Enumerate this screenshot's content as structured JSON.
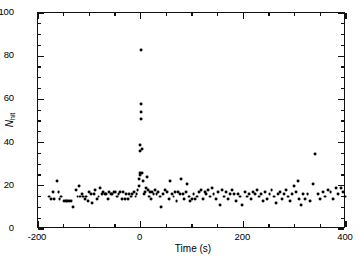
{
  "chart_data": {
    "type": "scatter",
    "title": "",
    "xlabel": "Time (s)",
    "ylabel": "Nhit",
    "ylabel_base": "N",
    "ylabel_sub": "hit",
    "xlim": [
      -200,
      400
    ],
    "ylim": [
      0,
      100
    ],
    "xticks": [
      -200,
      0,
      200,
      400
    ],
    "xticklabels": [
      "-200",
      "0",
      "200",
      "400"
    ],
    "yticks": [
      0,
      20,
      40,
      60,
      80,
      100
    ],
    "yticklabels": [
      "0",
      "20",
      "40",
      "60",
      "80",
      "100"
    ],
    "x_minor_interval": 50,
    "y_minor_interval": 5,
    "grid": false,
    "legend": null,
    "marker": "filled-circle",
    "marker_color": "#000000",
    "marker_size_px": 2.9,
    "points": [
      [
        -178,
        15
      ],
      [
        -175,
        14
      ],
      [
        -170,
        17
      ],
      [
        -168,
        14
      ],
      [
        -163,
        22
      ],
      [
        -160,
        17
      ],
      [
        -158,
        14
      ],
      [
        -155,
        15
      ],
      [
        -149,
        13
      ],
      [
        -146,
        13
      ],
      [
        -143,
        13
      ],
      [
        -140,
        13
      ],
      [
        -136,
        13
      ],
      [
        -131,
        10
      ],
      [
        -126,
        18
      ],
      [
        -123,
        15
      ],
      [
        -120,
        20
      ],
      [
        -118,
        15
      ],
      [
        -115,
        16
      ],
      [
        -112,
        15
      ],
      [
        -109,
        14
      ],
      [
        -106,
        15
      ],
      [
        -103,
        13
      ],
      [
        -100,
        17
      ],
      [
        -97,
        16
      ],
      [
        -94,
        12
      ],
      [
        -91,
        16
      ],
      [
        -88,
        18
      ],
      [
        -85,
        14
      ],
      [
        -82,
        15
      ],
      [
        -79,
        19
      ],
      [
        -76,
        16
      ],
      [
        -73,
        17
      ],
      [
        -70,
        16
      ],
      [
        -67,
        16
      ],
      [
        -64,
        14
      ],
      [
        -61,
        17
      ],
      [
        -58,
        16
      ],
      [
        -55,
        16
      ],
      [
        -52,
        17
      ],
      [
        -49,
        17
      ],
      [
        -46,
        15
      ],
      [
        -43,
        16
      ],
      [
        -40,
        17
      ],
      [
        -37,
        14
      ],
      [
        -34,
        17
      ],
      [
        -31,
        14
      ],
      [
        -28,
        16
      ],
      [
        -25,
        14
      ],
      [
        -22,
        16
      ],
      [
        -19,
        15
      ],
      [
        -16,
        16
      ],
      [
        -13,
        17
      ],
      [
        -10,
        15
      ],
      [
        -8,
        16
      ],
      [
        -6,
        18
      ],
      [
        -4,
        20
      ],
      [
        -3,
        23
      ],
      [
        -2,
        25
      ],
      [
        -2,
        26
      ],
      [
        -1,
        36
      ],
      [
        -1,
        39
      ],
      [
        0,
        51
      ],
      [
        0,
        54
      ],
      [
        0,
        58
      ],
      [
        1,
        83
      ],
      [
        2,
        37
      ],
      [
        3,
        26
      ],
      [
        4,
        22
      ],
      [
        6,
        16
      ],
      [
        8,
        17
      ],
      [
        10,
        19
      ],
      [
        12,
        24
      ],
      [
        14,
        18
      ],
      [
        16,
        15
      ],
      [
        18,
        17
      ],
      [
        20,
        14
      ],
      [
        22,
        17
      ],
      [
        25,
        16
      ],
      [
        28,
        18
      ],
      [
        31,
        16
      ],
      [
        34,
        17
      ],
      [
        37,
        15
      ],
      [
        40,
        10
      ],
      [
        44,
        16
      ],
      [
        48,
        18
      ],
      [
        52,
        17
      ],
      [
        55,
        14
      ],
      [
        58,
        22
      ],
      [
        61,
        16
      ],
      [
        64,
        15
      ],
      [
        67,
        17
      ],
      [
        70,
        13
      ],
      [
        73,
        17
      ],
      [
        76,
        16
      ],
      [
        79,
        23
      ],
      [
        82,
        16
      ],
      [
        85,
        14
      ],
      [
        88,
        17
      ],
      [
        91,
        21
      ],
      [
        94,
        15
      ],
      [
        97,
        13
      ],
      [
        100,
        14
      ],
      [
        103,
        16
      ],
      [
        106,
        14
      ],
      [
        109,
        15
      ],
      [
        113,
        17
      ],
      [
        117,
        18
      ],
      [
        121,
        14
      ],
      [
        125,
        17
      ],
      [
        128,
        16
      ],
      [
        131,
        18
      ],
      [
        135,
        15
      ],
      [
        139,
        19
      ],
      [
        142,
        16
      ],
      [
        146,
        14
      ],
      [
        150,
        17
      ],
      [
        154,
        11
      ],
      [
        158,
        18
      ],
      [
        162,
        15
      ],
      [
        166,
        17
      ],
      [
        170,
        14
      ],
      [
        174,
        16
      ],
      [
        178,
        18
      ],
      [
        182,
        16
      ],
      [
        186,
        13
      ],
      [
        190,
        16
      ],
      [
        194,
        15
      ],
      [
        198,
        11
      ],
      [
        203,
        17
      ],
      [
        207,
        15
      ],
      [
        211,
        16
      ],
      [
        215,
        14
      ],
      [
        219,
        17
      ],
      [
        223,
        16
      ],
      [
        227,
        18
      ],
      [
        231,
        15
      ],
      [
        235,
        16
      ],
      [
        239,
        13
      ],
      [
        243,
        17
      ],
      [
        247,
        14
      ],
      [
        251,
        16
      ],
      [
        255,
        18
      ],
      [
        259,
        15
      ],
      [
        263,
        12
      ],
      [
        267,
        16
      ],
      [
        271,
        17
      ],
      [
        275,
        14
      ],
      [
        279,
        16
      ],
      [
        283,
        18
      ],
      [
        287,
        15
      ],
      [
        291,
        13
      ],
      [
        295,
        16
      ],
      [
        298,
        20
      ],
      [
        302,
        17
      ],
      [
        306,
        22
      ],
      [
        309,
        14
      ],
      [
        313,
        11
      ],
      [
        317,
        16
      ],
      [
        321,
        14
      ],
      [
        325,
        16
      ],
      [
        330,
        13
      ],
      [
        335,
        21
      ],
      [
        340,
        34.5
      ],
      [
        345,
        16
      ],
      [
        350,
        14
      ],
      [
        355,
        17
      ],
      [
        360,
        15
      ],
      [
        365,
        18
      ],
      [
        370,
        17
      ],
      [
        375,
        14
      ],
      [
        380,
        19
      ],
      [
        385,
        16
      ],
      [
        390,
        19
      ],
      [
        394,
        17
      ],
      [
        398,
        15
      ]
    ]
  },
  "axes": {
    "x_title": "Time (s)",
    "y_title_base": "N",
    "y_title_sub": "hit"
  }
}
